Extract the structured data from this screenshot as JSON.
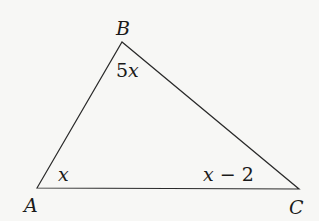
{
  "diagram": {
    "type": "triangle",
    "vertices": [
      {
        "name": "A",
        "x": 37,
        "y": 188
      },
      {
        "name": "B",
        "x": 122,
        "y": 42
      },
      {
        "name": "C",
        "x": 299,
        "y": 189
      }
    ],
    "vertex_labels": {
      "A": "A",
      "B": "B",
      "C": "C"
    },
    "angle_labels": {
      "A": "x",
      "B_coef": "5",
      "B_var": "x",
      "C_var": "x",
      "C_op": "−",
      "C_const": "2"
    },
    "stroke_color": "#2a2a2a",
    "background_color": "#f7f7f5"
  }
}
